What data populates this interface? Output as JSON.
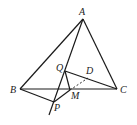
{
  "figure": {
    "points": {
      "A": {
        "label": "A",
        "x": 83,
        "y": 19
      },
      "B": {
        "label": "B",
        "x": 20,
        "y": 89
      },
      "C": {
        "label": "C",
        "x": 117,
        "y": 89
      },
      "Q": {
        "label": "Q",
        "x": 65,
        "y": 71
      },
      "D": {
        "label": "D",
        "x": 88,
        "y": 78
      },
      "M": {
        "label": "M",
        "x": 70,
        "y": 90
      },
      "P": {
        "label": "P",
        "x": 54,
        "y": 102
      }
    },
    "line_color": "#1a1a1a"
  }
}
